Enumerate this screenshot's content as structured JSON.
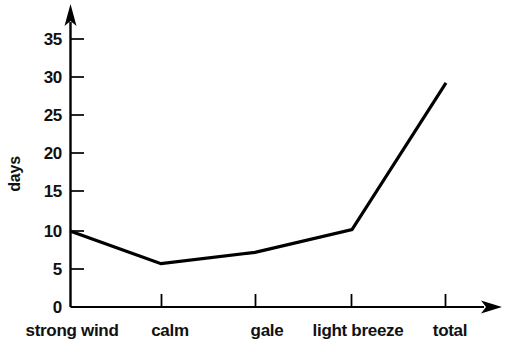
{
  "chart_data": {
    "type": "line",
    "title": "",
    "subtitle": "",
    "xlabel": "",
    "ylabel": "days",
    "categories": [
      "strong wind",
      "calm",
      "gale",
      "light breeze",
      "total"
    ],
    "values": [
      10.0,
      5.7,
      7.2,
      10.2,
      29.5
    ],
    "series": [
      {
        "name": "days",
        "values": [
          10.0,
          5.7,
          7.2,
          10.2,
          29.5
        ]
      }
    ],
    "ylim": [
      0,
      37
    ],
    "xlim": [
      0,
      5.5
    ],
    "y_ticks": [
      0,
      5,
      10,
      15,
      20,
      25,
      30,
      35
    ],
    "y_tick_labels": [
      "0",
      "5",
      "10",
      "15",
      "20",
      "25",
      "30",
      "35"
    ],
    "grid": false,
    "legend": false,
    "legend_position": "none",
    "line_color": "#000000",
    "axis_color": "#000000",
    "background_color": "#ffffff",
    "annotations": []
  },
  "axes": {
    "y_title": "days",
    "y_tick_labels": [
      "35",
      "30",
      "25",
      "20",
      "15",
      "10",
      "5",
      "0"
    ],
    "x_tick_labels": [
      "strong wind",
      "calm",
      "gale",
      "light breeze",
      "total"
    ]
  },
  "icons": {
    "y_arrow": "up-arrow-icon",
    "x_arrow": "right-arrow-icon"
  }
}
